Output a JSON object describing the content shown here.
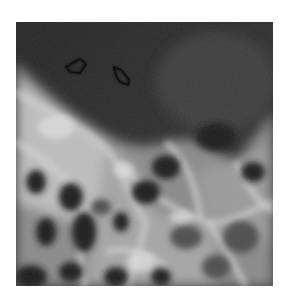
{
  "image": {
    "description": "Grayscale radiograph showing a dark upper region bordered by bright trabecular-like structures with dark lacunae below; two open arrowhead markers point to spots in the dark region",
    "annotations": [
      {
        "type": "arrowhead",
        "label": "arrow-1"
      },
      {
        "type": "arrowhead",
        "label": "arrow-2"
      }
    ],
    "colors": {
      "background": "#ffffff",
      "dark_region": "#2b2b2b",
      "bright_structure": "#c8c8c8",
      "marker_outline": "#0a0a0a"
    }
  }
}
